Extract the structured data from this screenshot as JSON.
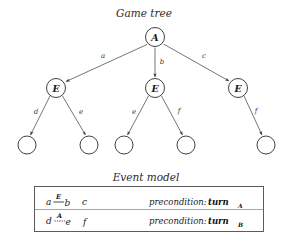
{
  "figure": {
    "tree_caption": "Game tree",
    "model_caption": "Event model"
  },
  "tree": {
    "root": {
      "label": "A",
      "x": 155,
      "y": 37,
      "r": 9.5
    },
    "level1": [
      {
        "label": "E",
        "x": 56,
        "y": 88,
        "r": 9.5
      },
      {
        "label": "E",
        "x": 155,
        "y": 88,
        "r": 9.5
      },
      {
        "label": "E",
        "x": 238,
        "y": 88,
        "r": 9.5
      }
    ],
    "leaves": [
      {
        "x": 27,
        "y": 145,
        "r": 9.0
      },
      {
        "x": 89,
        "y": 145,
        "r": 9.0
      },
      {
        "x": 124,
        "y": 145,
        "r": 9.0
      },
      {
        "x": 186,
        "y": 145,
        "r": 9.0
      },
      {
        "x": 266,
        "y": 145,
        "r": 9.0
      }
    ],
    "edges_level1": [
      {
        "label": "a",
        "from": "root",
        "to": 0,
        "lx": 103,
        "ly": 58
      },
      {
        "label": "b",
        "from": "root",
        "to": 1,
        "lx": 162,
        "ly": 63
      },
      {
        "label": "c",
        "from": "root",
        "to": 2,
        "lx": 203,
        "ly": 58
      }
    ],
    "edges_level2": [
      {
        "label": "d",
        "from": 0,
        "to": 0,
        "lx": 36,
        "ly": 113
      },
      {
        "label": "e",
        "from": 0,
        "to": 1,
        "lx": 80,
        "ly": 113
      },
      {
        "label": "e",
        "from": 1,
        "to": 2,
        "lx": 134,
        "ly": 113
      },
      {
        "label": "f",
        "from": 1,
        "to": 3,
        "lx": 178,
        "ly": 113
      },
      {
        "label": "f",
        "from": 2,
        "to": 4,
        "lx": 256,
        "ly": 113
      }
    ]
  },
  "event_model": {
    "box": {
      "x": 34,
      "y": 186,
      "w": 230,
      "h": 46
    },
    "rows": [
      {
        "left_event": "a",
        "relation_agent": "E",
        "relation_style": "solid",
        "right_event": "b",
        "extra_event": "c",
        "precondition_label": "precondition:",
        "precondition_term": "turn",
        "precondition_sub": "A"
      },
      {
        "left_event": "d",
        "relation_agent": "A",
        "relation_style": "dashed",
        "right_event": "e",
        "extra_event": "f",
        "precondition_label": "precondition:",
        "precondition_term": "turn",
        "precondition_sub": "B"
      }
    ]
  },
  "colors": {
    "ink": "#2b2b2b",
    "background": "#ffffff",
    "rule": "#4a4a4a"
  }
}
